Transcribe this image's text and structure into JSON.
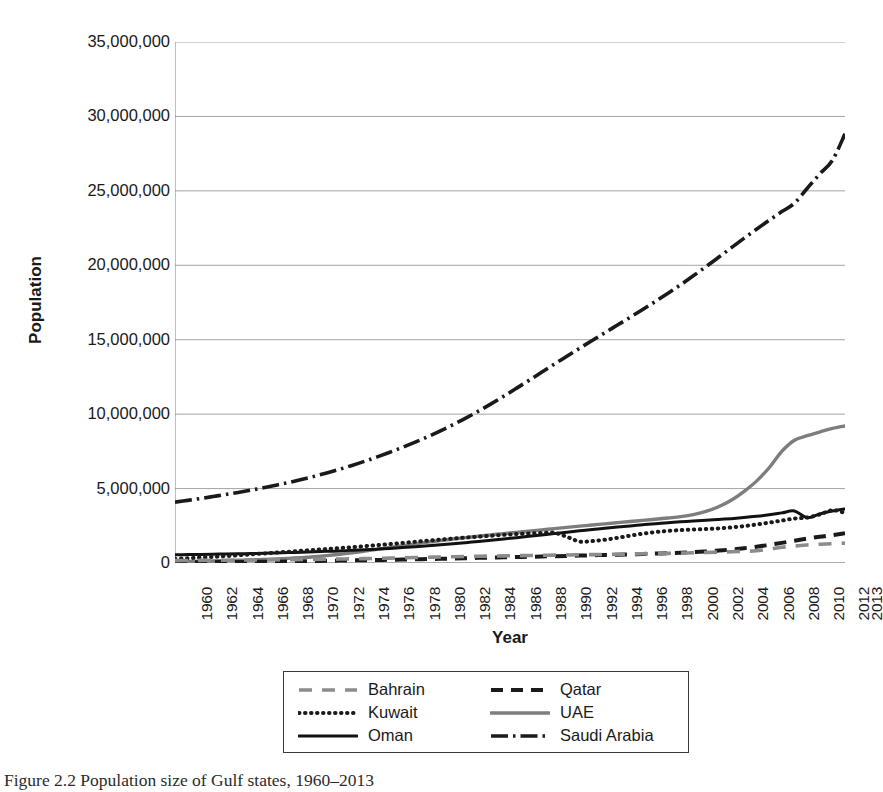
{
  "caption": "Figure 2.2 Population size of Gulf states, 1960–2013",
  "axis": {
    "y_title": "Population",
    "x_title": "Year"
  },
  "legend": {
    "entries": [
      {
        "label": "Bahrain",
        "style": "dashed-light",
        "color": "#8c8c8c"
      },
      {
        "label": "Qatar",
        "style": "dashed-dark",
        "color": "#1a1a1a"
      },
      {
        "label": "Kuwait",
        "style": "dotted",
        "color": "#1a1a1a"
      },
      {
        "label": "UAE",
        "style": "solid-light",
        "color": "#7d7d7d"
      },
      {
        "label": "Oman",
        "style": "solid-dark",
        "color": "#111111"
      },
      {
        "label": "Saudi Arabia",
        "style": "dash-dot",
        "color": "#1a1a1a"
      }
    ]
  },
  "chart_data": {
    "type": "line",
    "title": "Population size of Gulf states, 1960–2013",
    "xlabel": "Year",
    "ylabel": "Population",
    "xlim": [
      1960,
      2013
    ],
    "ylim": [
      0,
      35000000
    ],
    "ytick_labels": [
      "35,000,000",
      "30,000,000",
      "25,000,000",
      "20,000,000",
      "15,000,000",
      "10,000,000",
      "5,000,000",
      "0"
    ],
    "ytick_values": [
      35000000,
      30000000,
      25000000,
      20000000,
      15000000,
      10000000,
      5000000,
      0
    ],
    "xtick_labels": [
      "1960",
      "1962",
      "1964",
      "1966",
      "1968",
      "1970",
      "1972",
      "1974",
      "1976",
      "1978",
      "1980",
      "1982",
      "1984",
      "1986",
      "1988",
      "1990",
      "1992",
      "1994",
      "1996",
      "1998",
      "2000",
      "2002",
      "2004",
      "2006",
      "2008",
      "2010",
      "2012",
      "2013"
    ],
    "grid": "horizontal",
    "legend_position": "bottom",
    "x": [
      1960,
      1961,
      1962,
      1963,
      1964,
      1965,
      1966,
      1967,
      1968,
      1969,
      1970,
      1971,
      1972,
      1973,
      1974,
      1975,
      1976,
      1977,
      1978,
      1979,
      1980,
      1981,
      1982,
      1983,
      1984,
      1985,
      1986,
      1987,
      1988,
      1989,
      1990,
      1991,
      1992,
      1993,
      1994,
      1995,
      1996,
      1997,
      1998,
      1999,
      2000,
      2001,
      2002,
      2003,
      2004,
      2005,
      2006,
      2007,
      2008,
      2009,
      2010,
      2011,
      2012,
      2013
    ],
    "series": [
      {
        "name": "Saudi Arabia",
        "style": "dash-dot",
        "color": "#1a1a1a",
        "values": [
          4086000,
          4206000,
          4331000,
          4462000,
          4599000,
          4743000,
          4895000,
          5056000,
          5227000,
          5410000,
          5607000,
          5819000,
          6047000,
          6291000,
          6553000,
          6832000,
          7128000,
          7441000,
          7772000,
          8120000,
          8488000,
          8878000,
          9293000,
          9733000,
          10199000,
          10689000,
          11201000,
          11730000,
          12269000,
          12813000,
          13355000,
          13891000,
          14421000,
          14945000,
          15465000,
          15983000,
          16503000,
          17030000,
          17569000,
          18124000,
          18698000,
          19293000,
          19908000,
          20538000,
          21174000,
          21806000,
          22424000,
          23024000,
          23606000,
          24172000,
          25162000,
          26132000,
          27046000,
          28829000
        ]
      },
      {
        "name": "UAE",
        "style": "solid-light",
        "color": "#7d7d7d",
        "values": [
          92000,
          105000,
          120000,
          137000,
          157000,
          180000,
          206000,
          236000,
          271000,
          311000,
          358000,
          417000,
          492000,
          582000,
          685000,
          798000,
          918000,
          1042000,
          1166000,
          1286000,
          1400000,
          1508000,
          1611000,
          1708000,
          1801000,
          1890000,
          1975000,
          2059000,
          2142000,
          2226000,
          2309000,
          2392000,
          2474000,
          2554000,
          2632000,
          2709000,
          2786000,
          2863000,
          2943000,
          3026000,
          3114000,
          3250000,
          3470000,
          3780000,
          4220000,
          4800000,
          5500000,
          6400000,
          7500000,
          8250000,
          8550000,
          8800000,
          9040000,
          9206000
        ]
      },
      {
        "name": "Oman",
        "style": "solid-dark",
        "color": "#111111",
        "values": [
          551000,
          563000,
          576000,
          590000,
          604000,
          620000,
          637000,
          656000,
          677000,
          700000,
          724000,
          751000,
          781000,
          813000,
          849000,
          889000,
          933000,
          982000,
          1035000,
          1092000,
          1154000,
          1220000,
          1291000,
          1366000,
          1445000,
          1528000,
          1614000,
          1703000,
          1794000,
          1886000,
          1978000,
          2069000,
          2159000,
          2247000,
          2332000,
          2415000,
          2493000,
          2568000,
          2638000,
          2704000,
          2765000,
          2821000,
          2874000,
          2925000,
          2981000,
          3049000,
          3133000,
          3240000,
          3367000,
          3494000,
          3041000,
          3295000,
          3491000,
          3632000
        ]
      },
      {
        "name": "Kuwait",
        "style": "dotted",
        "color": "#1a1a1a",
        "values": [
          292000,
          327000,
          367000,
          412000,
          462000,
          517000,
          576000,
          637000,
          699000,
          760000,
          821000,
          880000,
          939000,
          999000,
          1062000,
          1129000,
          1199000,
          1272000,
          1348000,
          1424000,
          1499000,
          1572000,
          1642000,
          1709000,
          1773000,
          1833000,
          1890000,
          1942000,
          1986000,
          2017000,
          2029000,
          1759000,
          1443000,
          1472000,
          1563000,
          1692000,
          1836000,
          1970000,
          2077000,
          2155000,
          2210000,
          2249000,
          2284000,
          2327000,
          2390000,
          2476000,
          2585000,
          2713000,
          2851000,
          2988000,
          3051000,
          3259000,
          3543000,
          3369000
        ]
      },
      {
        "name": "Qatar",
        "style": "dashed-dark",
        "color": "#1a1a1a",
        "values": [
          47000,
          51000,
          55000,
          59000,
          64000,
          69000,
          75000,
          81000,
          88000,
          96000,
          111000,
          128000,
          145000,
          161000,
          175000,
          189000,
          202000,
          215000,
          230000,
          246000,
          264000,
          283000,
          304000,
          325000,
          345000,
          364000,
          382000,
          400000,
          418000,
          437000,
          457000,
          478000,
          499000,
          520000,
          541000,
          562000,
          583000,
          606000,
          631000,
          659000,
          692000,
          732000,
          780000,
          838000,
          908000,
          994000,
          1098000,
          1218000,
          1352000,
          1493000,
          1635000,
          1765000,
          1875000,
          2003000
        ]
      },
      {
        "name": "Bahrain",
        "style": "dashed-light",
        "color": "#8c8c8c",
        "values": [
          162000,
          168000,
          174000,
          181000,
          188000,
          195000,
          202000,
          209000,
          217000,
          225000,
          234000,
          243000,
          253000,
          265000,
          278000,
          293000,
          310000,
          328000,
          347000,
          366000,
          385000,
          403000,
          420000,
          436000,
          451000,
          465000,
          478000,
          491000,
          503000,
          515000,
          527000,
          539000,
          551000,
          563000,
          576000,
          589000,
          603000,
          617000,
          632000,
          648000,
          666000,
          686000,
          708000,
          733000,
          760000,
          790000,
          823000,
          936000,
          1054000,
          1136000,
          1214000,
          1260000,
          1300000,
          1332000
        ]
      }
    ]
  }
}
